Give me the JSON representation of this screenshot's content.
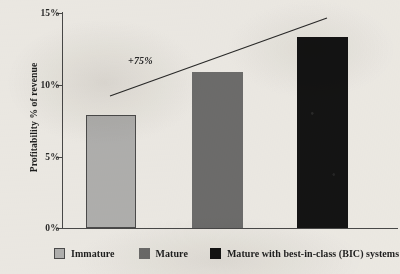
{
  "chart_data": {
    "type": "bar",
    "title": "",
    "subtitle": "",
    "xlabel": "",
    "ylabel": "Profitability % of revenue",
    "categories": [
      "Immature",
      "Mature",
      "Mature with best-in-class (BIC) systems"
    ],
    "values": [
      7.9,
      10.9,
      13.35
    ],
    "value_labels": [
      "7.9%",
      "10.9%",
      "13.35%"
    ],
    "ylim": [
      0,
      15
    ],
    "yticks": [
      0,
      5,
      10,
      15
    ],
    "ytick_labels": [
      "0%",
      "5%",
      "10%",
      "15%"
    ],
    "grid": false,
    "legend_position": "bottom",
    "legend": [
      {
        "label": "Immature",
        "color": "#b4b4b4"
      },
      {
        "label": "Mature",
        "color": "#6f6f6f"
      },
      {
        "label": "Mature with best-in-class (BIC) systems",
        "color": "#141414"
      }
    ],
    "annotations": [
      {
        "text": "+75%",
        "type": "growth-callout",
        "style": "italic"
      }
    ],
    "trend_line": {
      "label": "+75%",
      "from": [
        110,
        96
      ],
      "to": [
        327,
        18
      ],
      "color": "#2b2b2b"
    }
  },
  "axis": {
    "y_title": "Profitability % of revenue",
    "ticks": [
      {
        "label": "15%",
        "top": 8
      },
      {
        "label": "10%",
        "top": 80
      },
      {
        "label": "5%",
        "top": 152
      },
      {
        "label": "0%",
        "top": 223
      }
    ],
    "tick_marks": [
      13,
      85,
      157,
      228
    ]
  },
  "bars": [
    {
      "name": "immature",
      "label": "Immature",
      "value": 7.9,
      "left": 86,
      "width": 50,
      "height": 113,
      "color": "#b4b4b4"
    },
    {
      "name": "mature",
      "label": "Mature",
      "value": 10.9,
      "left": 192,
      "width": 51,
      "height": 156,
      "color": "#6f6f6f"
    },
    {
      "name": "bic",
      "label": "Mature with best-in-class (BIC) systems",
      "value": 13.35,
      "left": 297,
      "width": 51,
      "height": 191,
      "color": "#141414"
    }
  ],
  "annotation": {
    "growth": "+75%"
  },
  "legend": {
    "items": [
      {
        "label": "Immature",
        "color": "#b4b4b4"
      },
      {
        "label": "Mature",
        "color": "#6f6f6f"
      },
      {
        "label": "Mature with best-in-class (BIC) systems",
        "color": "#141414"
      }
    ]
  },
  "colors": {
    "background": "#f2f0ec",
    "axis": "#4a4a4a",
    "text": "#1f1f1f",
    "immature": "#b4b4b4",
    "mature": "#6f6f6f",
    "bic": "#141414"
  }
}
